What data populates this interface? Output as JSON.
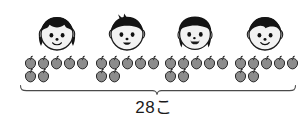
{
  "figure": {
    "type": "pictograph",
    "children": [
      {
        "id": "child-1",
        "icon": "girl-face-pigtails-icon",
        "hair": "pigtails",
        "mouth": "smile",
        "x": 35,
        "apples": 7
      },
      {
        "id": "child-2",
        "icon": "boy-face-spiky-icon",
        "hair": "spiky-short",
        "mouth": "open-smile",
        "x": 105,
        "apples": 7
      },
      {
        "id": "child-3",
        "icon": "girl-face-bob-icon",
        "hair": "bob",
        "mouth": "open-laugh",
        "x": 173,
        "apples": 7
      },
      {
        "id": "child-4",
        "icon": "boy-face-short-icon",
        "hair": "short",
        "mouth": "smile",
        "x": 243,
        "apples": 7
      }
    ],
    "apple_groups": [
      {
        "id": "apple-group-1",
        "x": 24,
        "top_row": 5,
        "bottom_row": 2,
        "count": 7
      },
      {
        "id": "apple-group-2",
        "x": 95,
        "top_row": 5,
        "bottom_row": 2,
        "count": 7
      },
      {
        "id": "apple-group-3",
        "x": 164,
        "top_row": 5,
        "bottom_row": 2,
        "count": 7
      },
      {
        "id": "apple-group-4",
        "x": 234,
        "top_row": 5,
        "bottom_row": 2,
        "count": 7
      }
    ],
    "brace": {
      "name": "total-brace",
      "left": 20,
      "right": 296,
      "center": 157
    },
    "total_label": "28こ",
    "colors": {
      "apple_body": "#8c8c8c",
      "apple_outline": "#2b2b2b",
      "apple_stem": "#1a1a1a",
      "hair": "#141414",
      "face_fill": "#f2f2f2",
      "face_outline": "#1a1a1a",
      "brace": "#4a4a4a",
      "text": "#1b1b1b",
      "background": "#ffffff"
    }
  },
  "chart_data": {
    "type": "bar",
    "title": "28こ",
    "xlabel": "",
    "ylabel": "",
    "categories": [
      "child-1",
      "child-2",
      "child-3",
      "child-4"
    ],
    "values": [
      7,
      7,
      7,
      7
    ],
    "total": 28,
    "unit": "こ",
    "grid": false,
    "legend": "none",
    "ylim": [
      0,
      7
    ]
  }
}
